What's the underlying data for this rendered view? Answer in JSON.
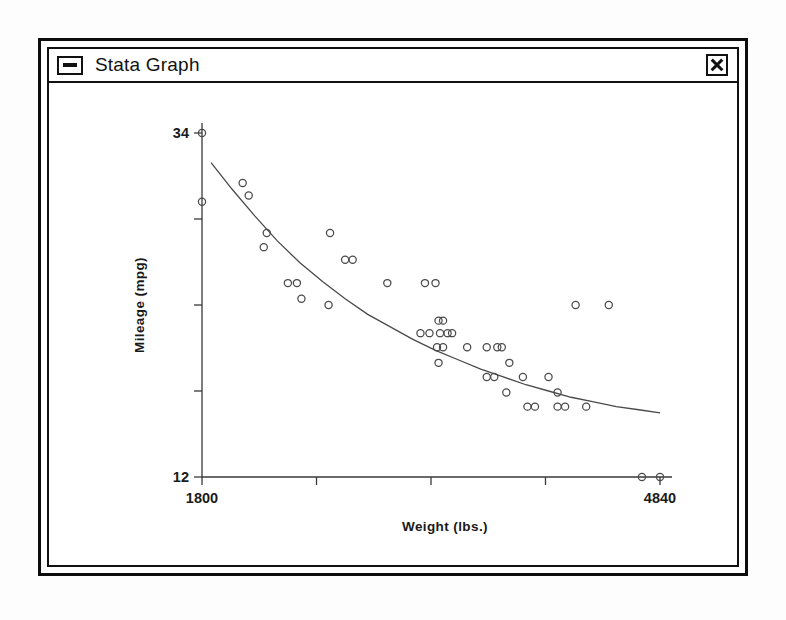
{
  "window": {
    "title": "Stata Graph",
    "sysmenu_icon": "minimize-box-icon",
    "close_icon": "close-x-icon"
  },
  "chart_data": {
    "type": "scatter",
    "title": "",
    "xlabel": "Weight (lbs.)",
    "ylabel": "Mileage (mpg)",
    "xlim": [
      1800,
      4840
    ],
    "ylim": [
      12,
      34
    ],
    "xticks": [
      1800,
      2560,
      3320,
      4080,
      4840
    ],
    "xticklabels": [
      "1800",
      "",
      "",
      "",
      "4840"
    ],
    "yticks": [
      34,
      28.5,
      23,
      17.5,
      12
    ],
    "yticklabels": [
      "34",
      "",
      "",
      "",
      "12"
    ],
    "grid": false,
    "legend": null,
    "marker": "open-circle",
    "series": [
      {
        "name": "Mileage vs Weight",
        "type": "scatter",
        "points": [
          [
            1800,
            34.0
          ],
          [
            1800,
            29.6
          ],
          [
            2070,
            30.8
          ],
          [
            2110,
            30.0
          ],
          [
            2230,
            27.6
          ],
          [
            2210,
            26.7
          ],
          [
            2650,
            27.6
          ],
          [
            2750,
            25.9
          ],
          [
            2800,
            25.9
          ],
          [
            2370,
            24.4
          ],
          [
            2430,
            24.4
          ],
          [
            2460,
            23.4
          ],
          [
            3030,
            24.4
          ],
          [
            3280,
            24.4
          ],
          [
            3350,
            24.4
          ],
          [
            2640,
            23.0
          ],
          [
            4280,
            23.0
          ],
          [
            4500,
            23.0
          ],
          [
            3370,
            22.0
          ],
          [
            3400,
            22.0
          ],
          [
            3250,
            21.2
          ],
          [
            3310,
            21.2
          ],
          [
            3380,
            21.2
          ],
          [
            3430,
            21.2
          ],
          [
            3460,
            21.2
          ],
          [
            3360,
            20.3
          ],
          [
            3400,
            20.3
          ],
          [
            3560,
            20.3
          ],
          [
            3690,
            20.3
          ],
          [
            3760,
            20.3
          ],
          [
            3790,
            20.3
          ],
          [
            3370,
            19.3
          ],
          [
            3840,
            19.3
          ],
          [
            3690,
            18.4
          ],
          [
            3740,
            18.4
          ],
          [
            3930,
            18.4
          ],
          [
            4100,
            18.4
          ],
          [
            3820,
            17.4
          ],
          [
            4160,
            17.4
          ],
          [
            3960,
            16.5
          ],
          [
            4010,
            16.5
          ],
          [
            4160,
            16.5
          ],
          [
            4210,
            16.5
          ],
          [
            4350,
            16.5
          ],
          [
            4720,
            12.0
          ],
          [
            4840,
            12.0
          ]
        ]
      },
      {
        "name": "Fitted curve",
        "type": "line",
        "points": [
          [
            1860,
            32.1
          ],
          [
            2000,
            30.4
          ],
          [
            2150,
            28.7
          ],
          [
            2300,
            27.1
          ],
          [
            2450,
            25.7
          ],
          [
            2600,
            24.5
          ],
          [
            2750,
            23.4
          ],
          [
            2900,
            22.4
          ],
          [
            3050,
            21.6
          ],
          [
            3200,
            20.8
          ],
          [
            3350,
            20.1
          ],
          [
            3500,
            19.5
          ],
          [
            3650,
            18.9
          ],
          [
            3800,
            18.4
          ],
          [
            3950,
            17.9
          ],
          [
            4100,
            17.5
          ],
          [
            4250,
            17.1
          ],
          [
            4400,
            16.8
          ],
          [
            4550,
            16.5
          ],
          [
            4700,
            16.3
          ],
          [
            4840,
            16.1
          ]
        ]
      }
    ]
  }
}
